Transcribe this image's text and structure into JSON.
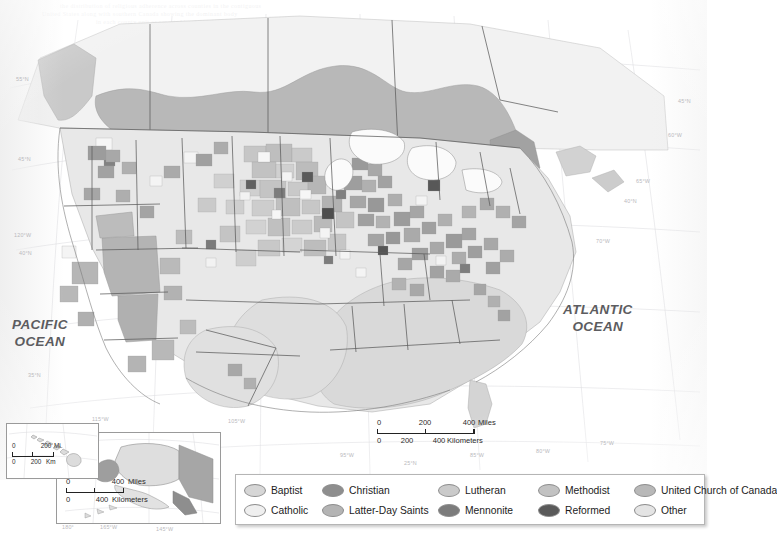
{
  "map": {
    "title": "Predominant Christian denomination by county, United States and Canada",
    "ocean_labels": [
      {
        "name": "pacific",
        "text": "PACIFIC\nOCEAN"
      },
      {
        "name": "atlantic",
        "text": "ATLANTIC\nOCEAN"
      }
    ],
    "scan_bleed_lines": [
      "the distribution of religious adherence across counties in the contiguous",
      "United States along with southern Canada showing the dominant body",
      "in each county unit as reported by the congregational membership study"
    ]
  },
  "legend": {
    "items": [
      {
        "label": "Baptist",
        "color": "#d6d6d6"
      },
      {
        "label": "Catholic",
        "color": "#efefef"
      },
      {
        "label": "Christian",
        "color": "#8e8e8e"
      },
      {
        "label": "Latter-Day Saints",
        "color": "#b4b4b4"
      },
      {
        "label": "Lutheran",
        "color": "#cacaca"
      },
      {
        "label": "Mennonite",
        "color": "#7c7c7c"
      },
      {
        "label": "Methodist",
        "color": "#c2c2c2"
      },
      {
        "label": "Reformed",
        "color": "#5a5a5a"
      },
      {
        "label": "United Church of Canada",
        "color": "#b8b8b8"
      },
      {
        "label": "Other",
        "color": "#e4e4e4"
      }
    ],
    "column_order": [
      [
        "Baptist",
        "Catholic"
      ],
      [
        "Christian",
        "Latter-Day Saints"
      ],
      [
        "Lutheran",
        "Mennonite"
      ],
      [
        "Methodist",
        "Reformed"
      ],
      [
        "United Church of Canada",
        "Other"
      ]
    ]
  },
  "scalebars": {
    "main": {
      "miles": {
        "ticks": [
          "0",
          "200",
          "400"
        ],
        "unit": "Miles"
      },
      "kilometers": {
        "ticks": [
          "0",
          "200",
          "400"
        ],
        "unit": "Kilometers"
      }
    },
    "alaska": {
      "miles": {
        "ticks": [
          "0",
          "400"
        ],
        "unit": "Miles"
      },
      "kilometers": {
        "ticks": [
          "0",
          "400"
        ],
        "unit": "Kilometers"
      }
    },
    "hawaii": {
      "miles": {
        "ticks": [
          "0",
          "200"
        ],
        "unit": "Mi."
      },
      "kilometers": {
        "ticks": [
          "0",
          "200"
        ],
        "unit": "Km"
      }
    }
  },
  "graticule": {
    "left": [
      "55°N",
      "45°N",
      "120°W",
      "40°N",
      "35°N",
      "30°N"
    ],
    "right": [
      "45°N",
      "60°W",
      "65°W",
      "40°N",
      "70°W"
    ],
    "bottom": [
      "105°W",
      "95°W",
      "25°N",
      "85°W",
      "80°W",
      "75°W"
    ],
    "insets": [
      "115°W",
      "155°W",
      "125°W",
      "165°W",
      "145°W",
      "180°"
    ]
  },
  "insets": {
    "alaska": {
      "name": "Alaska inset"
    },
    "hawaii": {
      "name": "Hawaii inset"
    }
  }
}
